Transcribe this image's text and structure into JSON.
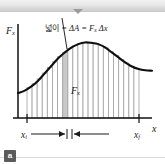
{
  "figure": {
    "panel_label": "a",
    "caption": {
      "korean_prefix": "넓이",
      "equation": " = ΔA = F",
      "equation_sub": "x",
      "equation_tail": " Δx"
    },
    "axes": {
      "y_label": "F",
      "y_label_sub": "x",
      "x_label": "x",
      "x_tick_start": "x",
      "x_tick_start_sub": "i",
      "x_tick_end": "x",
      "x_tick_end_sub": "f"
    },
    "annotations": {
      "bar_height_label": "F",
      "bar_height_label_sub": "x",
      "bar_width_label": "Δx"
    },
    "colors": {
      "curve": "#101010",
      "axis": "#101010",
      "strip_outline": "#a8a8a8",
      "strip_fill": "#ffffff",
      "highlight_fill": "#c9c9c9",
      "chrome": "#cfcfcf",
      "badge": "#5c5c5c"
    }
  },
  "chart_data": {
    "type": "area",
    "xlabel": "x",
    "ylabel": "F_x",
    "xlim": [
      0,
      1
    ],
    "ylim": [
      0,
      1
    ],
    "grid": false,
    "legend": null,
    "annotations": [
      "넓이 = ΔA = F_x Δx",
      "F_x",
      "Δx",
      "x_i",
      "x_f"
    ],
    "note": "Smooth rising-then-falling force curve; region between x_i and x_f divided into 22 thin vertical strips; strip #7 highlighted gray with height F_x and width Δx.",
    "n_strips": 22,
    "highlight_strip_index": 7,
    "x": [
      0.0,
      0.05,
      0.1,
      0.15,
      0.2,
      0.25,
      0.3,
      0.35,
      0.4,
      0.45,
      0.5,
      0.55,
      0.6,
      0.65,
      0.7,
      0.75,
      0.8,
      0.85,
      0.9,
      0.95,
      1.0
    ],
    "y": [
      0.3,
      0.33,
      0.38,
      0.45,
      0.54,
      0.63,
      0.72,
      0.79,
      0.85,
      0.89,
      0.91,
      0.905,
      0.89,
      0.85,
      0.79,
      0.73,
      0.67,
      0.62,
      0.59,
      0.575,
      0.57
    ]
  }
}
